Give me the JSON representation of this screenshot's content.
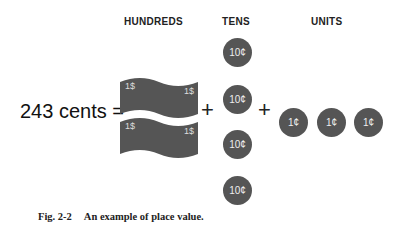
{
  "headers": {
    "hundreds": "HUNDREDS",
    "tens": "TENS",
    "units": "UNITS"
  },
  "equation": {
    "lhs": "243 cents =",
    "plus": "+"
  },
  "hundreds": {
    "bills": [
      {
        "label_left": "1$",
        "label_right": "1$"
      },
      {
        "label_left": "1$",
        "label_right": "1$"
      }
    ]
  },
  "tens": {
    "coins": [
      "10¢",
      "10¢",
      "10¢",
      "10¢"
    ]
  },
  "units": {
    "coins": [
      "1¢",
      "1¢",
      "1¢"
    ]
  },
  "caption": {
    "number": "Fig. 2-2",
    "text": "An example of place value."
  },
  "colors": {
    "money": "#555555"
  }
}
